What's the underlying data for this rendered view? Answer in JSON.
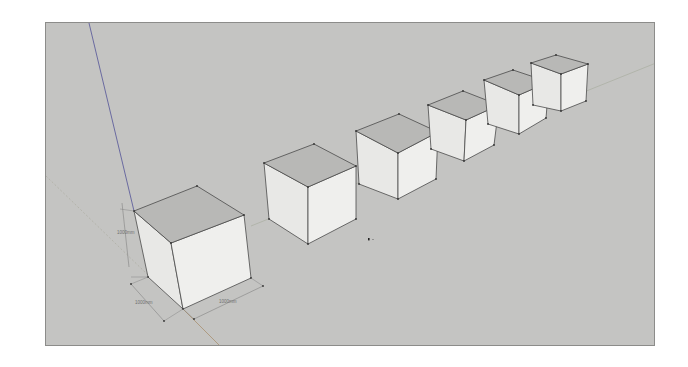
{
  "viewport": {
    "background": "#c4c4c2",
    "face_top": "#b8b8b6",
    "face_left": "#e8e8e6",
    "face_right": "#efefed",
    "edge": "#4a4a4a",
    "axis_blue": "#6a6aa0",
    "axis_red": "#a89070",
    "axis_green": "#9aa890"
  },
  "dimensions": {
    "height_label": "1000mm",
    "depth_label": "1000mm",
    "width_label": "1000mm"
  },
  "cubes": [
    {
      "name": "cube-1",
      "top": "133,210 196,185 243,214 170,242",
      "left": "133,210 170,242 182,308 147,276",
      "right": "170,242 243,214 250,277 182,308"
    },
    {
      "name": "cube-2",
      "top": "263,162 313,143 355,165 307,186",
      "left": "263,162 307,186 307,243 268,218",
      "right": "307,186 355,165 355,218 307,243"
    },
    {
      "name": "cube-3",
      "top": "355,130 398,113 437,131 397,152",
      "left": "355,130 397,152 397,198 358,183",
      "right": "397,152 437,131 435,178 397,198"
    },
    {
      "name": "cube-4",
      "top": "427,104 462,90 498,104 465,119",
      "left": "427,104 465,119 463,160 430,148",
      "right": "465,119 498,104 493,144 463,160"
    },
    {
      "name": "cube-5",
      "top": "483,79 512,69 548,81 518,94",
      "left": "483,79 518,94 518,133 487,123",
      "right": "518,94 548,81 545,117 518,133"
    },
    {
      "name": "cube-6",
      "top": "530,62 555,54 587,63 560,73",
      "left": "530,62 560,73 560,110 532,104",
      "right": "560,73 587,63 585,100 560,110"
    }
  ]
}
